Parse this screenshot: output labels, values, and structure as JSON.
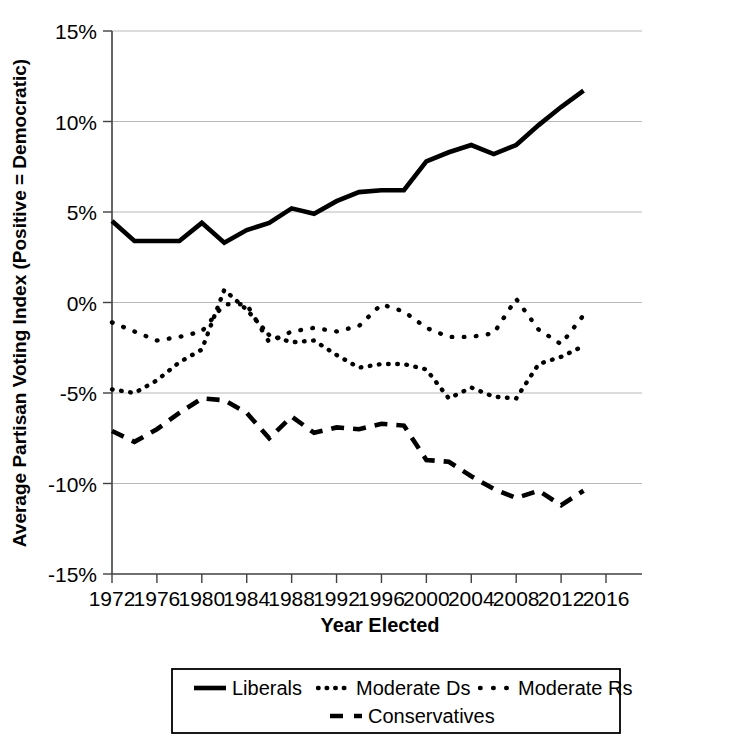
{
  "chart_data": {
    "type": "line",
    "title": "",
    "xlabel": "Year Elected",
    "ylabel": "Average Partisan Voting Index (Positive = Democratic)",
    "xlim": [
      1972,
      2016
    ],
    "ylim": [
      -15,
      15
    ],
    "grid": true,
    "legend_position": "bottom",
    "y_ticks": [
      "15%",
      "10%",
      "5%",
      "0%",
      "-5%",
      "-10%",
      "-15%"
    ],
    "y_tick_values": [
      15,
      10,
      5,
      0,
      -5,
      -10,
      -15
    ],
    "x_ticks": [
      "1972",
      "1976",
      "1980",
      "1984",
      "1988",
      "1992",
      "1996",
      "2000",
      "2004",
      "2008",
      "2012",
      "2016"
    ],
    "x_tick_values": [
      1972,
      1976,
      1980,
      1984,
      1988,
      1992,
      1996,
      2000,
      2004,
      2008,
      2012,
      2016
    ],
    "x": [
      1972,
      1974,
      1976,
      1978,
      1980,
      1982,
      1984,
      1986,
      1988,
      1990,
      1992,
      1994,
      1996,
      1998,
      2000,
      2002,
      2004,
      2006,
      2008,
      2010,
      2012,
      2014
    ],
    "series": [
      {
        "name": "Liberals",
        "style": "solid",
        "color": "#000000",
        "values": [
          4.5,
          3.4,
          3.4,
          3.4,
          4.4,
          3.3,
          4.0,
          4.4,
          5.2,
          4.9,
          5.6,
          6.1,
          6.2,
          6.2,
          7.8,
          8.3,
          8.7,
          8.2,
          8.7,
          9.8,
          10.8,
          11.7
        ]
      },
      {
        "name": "Moderate Ds",
        "style": "dotted-fine",
        "color": "#000000",
        "values": [
          -4.8,
          -5.0,
          -4.3,
          -3.3,
          -2.6,
          0.7,
          -0.4,
          -1.8,
          -2.2,
          -2.1,
          -2.9,
          -3.6,
          -3.4,
          -3.4,
          -3.7,
          -5.3,
          -4.7,
          -5.2,
          -5.3,
          -3.4,
          -3.0,
          -2.4
        ]
      },
      {
        "name": "Moderate Rs",
        "style": "dotted-coarse",
        "color": "#000000",
        "values": [
          -1.1,
          -1.6,
          -2.1,
          -1.9,
          -1.6,
          -0.1,
          -0.1,
          -2.2,
          -1.6,
          -1.4,
          -1.6,
          -1.3,
          -0.1,
          -0.5,
          -1.4,
          -1.9,
          -1.9,
          -1.7,
          0.2,
          -1.5,
          -2.3,
          -0.7
        ]
      },
      {
        "name": "Conservatives",
        "style": "dashed",
        "color": "#000000",
        "values": [
          -7.1,
          -7.7,
          -7.0,
          -6.1,
          -5.3,
          -5.4,
          -6.1,
          -7.5,
          -6.3,
          -7.2,
          -6.9,
          -7.0,
          -6.7,
          -6.8,
          -8.7,
          -8.8,
          -9.6,
          -10.3,
          -10.8,
          -10.4,
          -11.2,
          -10.4
        ]
      }
    ]
  },
  "legend": {
    "items": [
      {
        "label": "Liberals",
        "style": "solid"
      },
      {
        "label": "Moderate Ds",
        "style": "dotted-fine"
      },
      {
        "label": "Moderate Rs",
        "style": "dotted-coarse"
      },
      {
        "label": "Conservatives",
        "style": "dashed"
      }
    ]
  }
}
